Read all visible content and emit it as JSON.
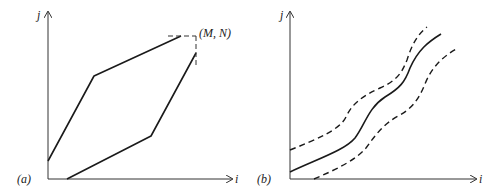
{
  "panels": [
    {
      "id": "a",
      "panel_label": "(a)",
      "x_axis_label": "i",
      "y_axis_label": "j",
      "endpoint_label": "(M, N)",
      "paths": {
        "upper_boundary": "solid polyline from j-axis rising steeply then slope shallow toward (M,N)",
        "lower_boundary": "solid polyline from i-axis rising shallow then steep toward (M,N)"
      }
    },
    {
      "id": "b",
      "panel_label": "(b)",
      "x_axis_label": "i",
      "y_axis_label": "j",
      "paths": {
        "center": "solid wavy warping path",
        "upper_band": "dashed band boundary above path",
        "lower_band": "dashed band boundary below path"
      }
    }
  ]
}
